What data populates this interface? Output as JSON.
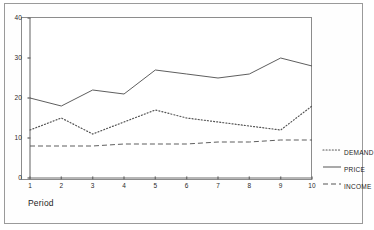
{
  "chart_data": {
    "type": "line",
    "title": "",
    "subtitle": "",
    "xlabel": "Period",
    "ylabel": "",
    "x": [
      1,
      2,
      3,
      4,
      5,
      6,
      7,
      8,
      9,
      10
    ],
    "categories": [
      "1",
      "2",
      "3",
      "4",
      "5",
      "6",
      "7",
      "8",
      "9",
      "10"
    ],
    "xlim": [
      1,
      10
    ],
    "ylim": [
      0,
      40
    ],
    "yticks": [
      0,
      10,
      20,
      30,
      40
    ],
    "ytick_labels": [
      "0",
      "10",
      "20",
      "30",
      "40"
    ],
    "xticks": [
      1,
      2,
      3,
      4,
      5,
      6,
      7,
      8,
      9,
      10
    ],
    "xtick_labels": [
      "1",
      "2",
      "3",
      "4",
      "5",
      "6",
      "7",
      "8",
      "9",
      "10"
    ],
    "grid": false,
    "legend_position": "right",
    "series": [
      {
        "name": "DEMAND",
        "style": "dotted",
        "color": "#555555",
        "values": [
          12,
          15,
          11,
          14,
          17,
          15,
          14,
          13,
          12,
          18
        ]
      },
      {
        "name": "PRICE",
        "style": "solid",
        "color": "#555555",
        "values": [
          20,
          18,
          22,
          21,
          27,
          26,
          25,
          26,
          30,
          28
        ]
      },
      {
        "name": "INCOME",
        "style": "dashed",
        "color": "#555555",
        "values": [
          8,
          8,
          8,
          8.5,
          8.5,
          8.5,
          9,
          9,
          9.5,
          9.5
        ]
      }
    ]
  },
  "axis": {
    "x_title": "Period",
    "y_tick_0": "0",
    "y_tick_1": "10",
    "y_tick_2": "20",
    "y_tick_3": "30",
    "y_tick_4": "40"
  },
  "legend": {
    "items": [
      {
        "label": "DEMAND",
        "style": "dotted"
      },
      {
        "label": "PRICE",
        "style": "solid"
      },
      {
        "label": "INCOME",
        "style": "dashed"
      }
    ]
  },
  "colors": {
    "line": "#555555",
    "axis": "#6f6f6f",
    "frame": "#9a9a9a",
    "plot_frame": "#8c8c8c",
    "text": "#1d1d1d",
    "background": "#ffffff"
  }
}
